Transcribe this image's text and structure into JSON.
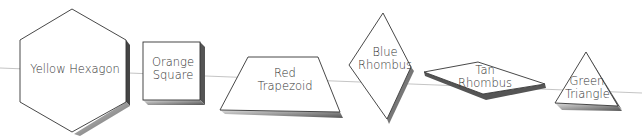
{
  "shapes": [
    {
      "id": "yellow-hexagon",
      "lines": [
        "Yellow Hexagon"
      ]
    },
    {
      "id": "orange-square",
      "lines": [
        "Orange",
        "Square"
      ]
    },
    {
      "id": "red-trapezoid",
      "lines": [
        "Red",
        "Trapezoid"
      ]
    },
    {
      "id": "blue-rhombus",
      "lines": [
        "Blue",
        "Rhombus"
      ]
    },
    {
      "id": "tan-rhombus",
      "lines": [
        "Tan",
        "Rhombus"
      ]
    },
    {
      "id": "green-triangle",
      "lines": [
        "Green",
        "Triangle"
      ]
    }
  ]
}
